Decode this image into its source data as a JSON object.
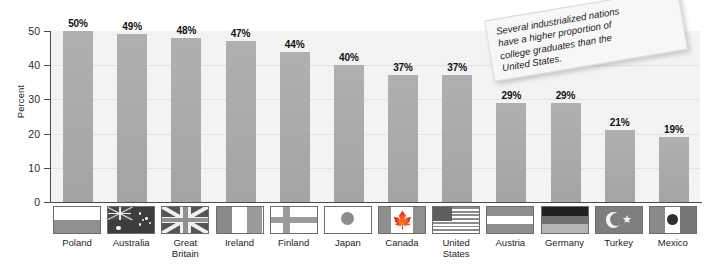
{
  "chart_data": {
    "type": "bar",
    "title": "",
    "xlabel": "",
    "ylabel": "Percent",
    "ylim": [
      0,
      50
    ],
    "yticks": [
      0,
      10,
      20,
      30,
      40,
      50
    ],
    "grid": true,
    "legend": "none",
    "categories": [
      "Poland",
      "Australia",
      "Great Britain",
      "Ireland",
      "Finland",
      "Japan",
      "Canada",
      "United States",
      "Austria",
      "Germany",
      "Turkey",
      "Mexico"
    ],
    "values": [
      50,
      49,
      48,
      47,
      44,
      40,
      37,
      37,
      29,
      29,
      21,
      19
    ],
    "data_labels": [
      "50%",
      "49%",
      "48%",
      "47%",
      "44%",
      "40%",
      "37%",
      "37%",
      "29%",
      "29%",
      "21%",
      "19%"
    ],
    "annotations": [
      "Several industrialized nations have a higher proportion of college graduates than the United States."
    ]
  },
  "axis": {
    "y_title": "Percent",
    "y_tick_labels": [
      "50",
      "40",
      "30",
      "20",
      "10",
      "0"
    ]
  },
  "callout": {
    "line1": "Several industrialized nations",
    "line2": "have a higher proportion of",
    "line3": "college graduates than the",
    "line4": "United States.",
    "text": "Several industrialized nations have a higher proportion of college graduates than the United States."
  },
  "bars": [
    {
      "country": "Poland",
      "label_line1": "Poland",
      "label_line2": "",
      "value": 50,
      "label": "50%",
      "flag": "flag-poland"
    },
    {
      "country": "Australia",
      "label_line1": "Australia",
      "label_line2": "",
      "value": 49,
      "label": "49%",
      "flag": "flag-australia"
    },
    {
      "country": "Great Britain",
      "label_line1": "Great",
      "label_line2": "Britain",
      "value": 48,
      "label": "48%",
      "flag": "flag-great-britain"
    },
    {
      "country": "Ireland",
      "label_line1": "Ireland",
      "label_line2": "",
      "value": 47,
      "label": "47%",
      "flag": "flag-ireland"
    },
    {
      "country": "Finland",
      "label_line1": "Finland",
      "label_line2": "",
      "value": 44,
      "label": "44%",
      "flag": "flag-finland"
    },
    {
      "country": "Japan",
      "label_line1": "Japan",
      "label_line2": "",
      "value": 40,
      "label": "40%",
      "flag": "flag-japan"
    },
    {
      "country": "Canada",
      "label_line1": "Canada",
      "label_line2": "",
      "value": 37,
      "label": "37%",
      "flag": "flag-canada"
    },
    {
      "country": "United States",
      "label_line1": "United",
      "label_line2": "States",
      "value": 37,
      "label": "37%",
      "flag": "flag-united-states"
    },
    {
      "country": "Austria",
      "label_line1": "Austria",
      "label_line2": "",
      "value": 29,
      "label": "29%",
      "flag": "flag-austria"
    },
    {
      "country": "Germany",
      "label_line1": "Germany",
      "label_line2": "",
      "value": 29,
      "label": "29%",
      "flag": "flag-germany"
    },
    {
      "country": "Turkey",
      "label_line1": "Turkey",
      "label_line2": "",
      "value": 21,
      "label": "21%",
      "flag": "flag-turkey"
    },
    {
      "country": "Mexico",
      "label_line1": "Mexico",
      "label_line2": "",
      "value": 19,
      "label": "19%",
      "flag": "flag-mexico"
    }
  ],
  "colors": {
    "bar": "#a8a8a8",
    "plot_background": "#f3f3f3",
    "axis": "#4a4a4a",
    "gridline": "#e3e3e3",
    "text": "#1d1d1d",
    "callout_background": "#f7f7f7"
  }
}
